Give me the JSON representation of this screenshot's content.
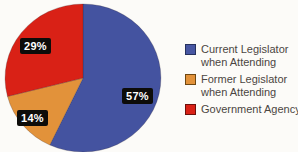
{
  "chart_data": {
    "type": "pie",
    "title": "",
    "categories": [
      "Current Legislator when Attending",
      "Former Legislator when Attending",
      "Government Agency"
    ],
    "values": [
      57,
      14,
      29
    ],
    "unit": "%",
    "colors": [
      "#4453a0",
      "#e2923a",
      "#d92116"
    ],
    "slice_labels": [
      "57%",
      "14%",
      "29%"
    ],
    "slice_label_bg": "#0d0c0a",
    "slice_label_text_color": "#ffffff",
    "start_angle_deg": 0,
    "direction": "clockwise",
    "legend_position": "right",
    "legend": [
      {
        "color": "#4756a2",
        "border": "#26315e",
        "lines": [
          "Current Legislator",
          "when Attending"
        ]
      },
      {
        "color": "#e2923a",
        "border": "#6e4712",
        "lines": [
          "Former Legislator",
          "when Attending"
        ]
      },
      {
        "color": "#d92116",
        "border": "#6e100b",
        "lines": [
          "Government Agency"
        ]
      }
    ],
    "legend_text_color": "#4b4642"
  }
}
